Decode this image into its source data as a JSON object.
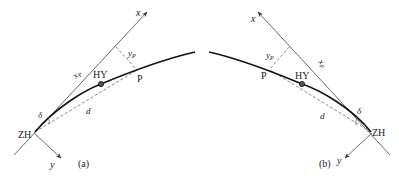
{
  "panels": [
    {
      "id": "a",
      "caption": "(a)",
      "labels": {
        "x_axis": "x",
        "y_axis": "y",
        "origin": "ZH",
        "point_hy": "HY",
        "point_p": "P",
        "x_coord": "x",
        "x_coord_sub": "P",
        "y_coord": "y",
        "y_coord_sub": "P",
        "angle": "δ",
        "chord": "d"
      }
    },
    {
      "id": "b",
      "caption": "(b)",
      "labels": {
        "x_axis": "x",
        "y_axis": "y",
        "origin": "ZH",
        "point_hy": "HY",
        "point_p": "P",
        "x_coord": "x",
        "x_coord_sub": "P",
        "y_coord": "y",
        "y_coord_sub": "P",
        "angle": "δ",
        "chord": "d"
      }
    }
  ],
  "colors": {
    "line": "#333333",
    "curve": "#111111",
    "background": "#ffffff"
  }
}
